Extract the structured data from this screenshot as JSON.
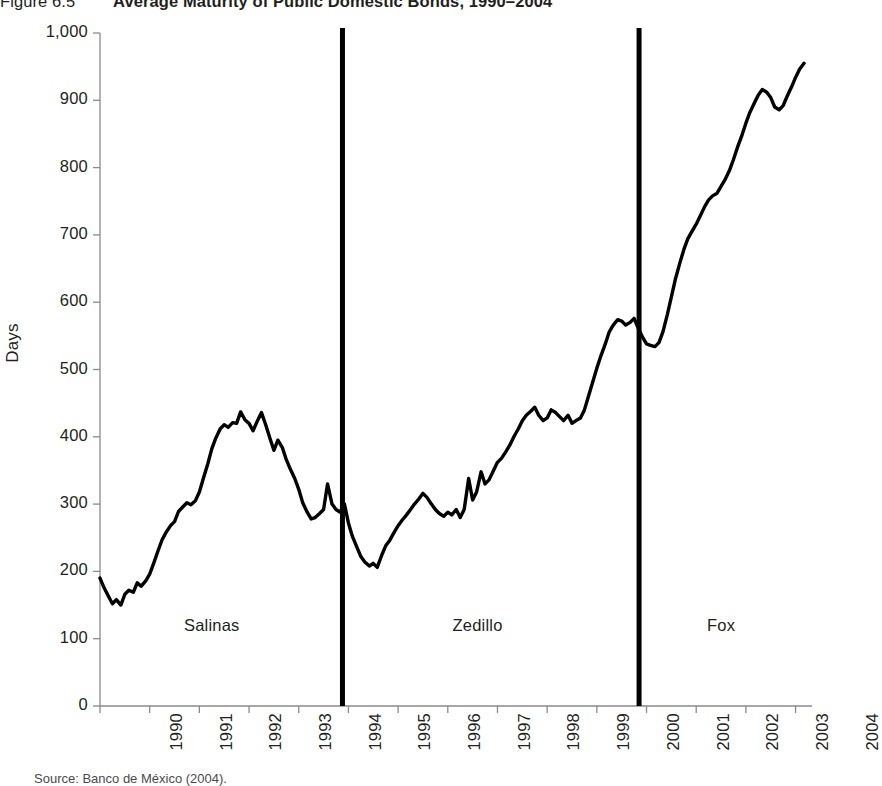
{
  "figure": {
    "number": "Figure 6.5",
    "title": "Average Maturity of Public Domestic Bonds, 1990–2004",
    "source": "Source: Banco de México (2004)."
  },
  "chart_data": {
    "type": "line",
    "title": "Average Maturity of Public Domestic Bonds, 1990–2004",
    "xlabel": "",
    "ylabel": "Days",
    "xlim": [
      1990,
      2004.25
    ],
    "ylim": [
      0,
      1000
    ],
    "grid": false,
    "legend": null,
    "line_color": "#000000",
    "line_width": 3.4,
    "y_ticks": [
      0,
      100,
      200,
      300,
      400,
      500,
      600,
      700,
      800,
      900,
      1000
    ],
    "y_tick_labels": [
      "0",
      "100",
      "200",
      "300",
      "400",
      "500",
      "600",
      "700",
      "800",
      "900",
      "1,000"
    ],
    "x_ticks": [
      1990,
      1991,
      1992,
      1993,
      1994,
      1995,
      1996,
      1997,
      1998,
      1999,
      2000,
      2001,
      2002,
      2003,
      2004
    ],
    "x_tick_labels": [
      "1990",
      "1991",
      "1992",
      "1993",
      "1994",
      "1995",
      "1996",
      "1997",
      "1998",
      "1999",
      "2000",
      "2001",
      "2002",
      "2003",
      "2004"
    ],
    "annotations": [
      {
        "label": "Salinas",
        "x": 1992.25,
        "y": 118
      },
      {
        "label": "Zedillo",
        "x": 1997.6,
        "y": 118
      },
      {
        "label": "Fox",
        "x": 2002.5,
        "y": 118
      }
    ],
    "vertical_rules": [
      {
        "x": 1994.88,
        "label": "Salinas/Zedillo transition",
        "color": "#000000",
        "width": 5
      },
      {
        "x": 2000.85,
        "label": "Zedillo/Fox transition",
        "color": "#000000",
        "width": 5
      }
    ],
    "series": [
      {
        "name": "Average maturity",
        "units": "Days",
        "x": [
          1990.0,
          1990.08,
          1990.17,
          1990.25,
          1990.33,
          1990.42,
          1990.5,
          1990.58,
          1990.67,
          1990.75,
          1990.83,
          1990.92,
          1991.0,
          1991.08,
          1991.17,
          1991.25,
          1991.33,
          1991.42,
          1991.5,
          1991.58,
          1991.67,
          1991.75,
          1991.83,
          1991.92,
          1992.0,
          1992.08,
          1992.17,
          1992.25,
          1992.33,
          1992.42,
          1992.5,
          1992.58,
          1992.67,
          1992.75,
          1992.83,
          1992.92,
          1993.0,
          1993.08,
          1993.17,
          1993.25,
          1993.33,
          1993.42,
          1993.5,
          1993.58,
          1993.67,
          1993.75,
          1993.83,
          1993.92,
          1994.0,
          1994.08,
          1994.17,
          1994.25,
          1994.33,
          1994.42,
          1994.5,
          1994.58,
          1994.67,
          1994.75,
          1994.83,
          1994.92,
          1995.0,
          1995.08,
          1995.17,
          1995.25,
          1995.33,
          1995.42,
          1995.5,
          1995.58,
          1995.67,
          1995.75,
          1995.83,
          1995.92,
          1996.0,
          1996.08,
          1996.17,
          1996.25,
          1996.33,
          1996.42,
          1996.5,
          1996.58,
          1996.67,
          1996.75,
          1996.83,
          1996.92,
          1997.0,
          1997.08,
          1997.17,
          1997.25,
          1997.33,
          1997.42,
          1997.5,
          1997.58,
          1997.67,
          1997.75,
          1997.83,
          1997.92,
          1998.0,
          1998.08,
          1998.17,
          1998.25,
          1998.33,
          1998.42,
          1998.5,
          1998.58,
          1998.67,
          1998.75,
          1998.83,
          1998.92,
          1999.0,
          1999.08,
          1999.17,
          1999.25,
          1999.33,
          1999.42,
          1999.5,
          1999.58,
          1999.67,
          1999.75,
          1999.83,
          1999.92,
          2000.0,
          2000.08,
          2000.17,
          2000.25,
          2000.33,
          2000.42,
          2000.5,
          2000.58,
          2000.67,
          2000.75,
          2000.83,
          2000.92,
          2001.0,
          2001.08,
          2001.17,
          2001.25,
          2001.33,
          2001.42,
          2001.5,
          2001.58,
          2001.67,
          2001.75,
          2001.83,
          2001.92,
          2002.0,
          2002.08,
          2002.17,
          2002.25,
          2002.33,
          2002.42,
          2002.5,
          2002.58,
          2002.67,
          2002.75,
          2002.83,
          2002.92,
          2003.0,
          2003.08,
          2003.17,
          2003.25,
          2003.33,
          2003.42,
          2003.5,
          2003.58,
          2003.67,
          2003.75,
          2003.83,
          2003.92,
          2004.0,
          2004.08,
          2004.17
        ],
        "y": [
          190,
          176,
          163,
          152,
          158,
          150,
          166,
          172,
          169,
          183,
          178,
          186,
          196,
          212,
          231,
          247,
          258,
          268,
          274,
          289,
          296,
          302,
          299,
          305,
          318,
          338,
          360,
          382,
          398,
          412,
          418,
          414,
          421,
          420,
          437,
          425,
          420,
          409,
          424,
          436,
          419,
          398,
          380,
          395,
          384,
          366,
          352,
          338,
          322,
          302,
          288,
          278,
          280,
          286,
          292,
          330,
          300,
          292,
          288,
          300,
          272,
          252,
          236,
          222,
          214,
          208,
          212,
          206,
          224,
          238,
          246,
          258,
          268,
          276,
          284,
          292,
          300,
          308,
          316,
          310,
          300,
          292,
          286,
          282,
          288,
          284,
          292,
          280,
          292,
          338,
          306,
          318,
          348,
          330,
          336,
          350,
          362,
          368,
          378,
          388,
          400,
          412,
          424,
          432,
          438,
          444,
          432,
          424,
          428,
          440,
          436,
          430,
          424,
          432,
          420,
          424,
          428,
          440,
          460,
          482,
          502,
          520,
          538,
          556,
          566,
          574,
          572,
          566,
          570,
          576,
          562,
          548,
          538,
          536,
          534,
          540,
          556,
          582,
          608,
          634,
          658,
          678,
          694,
          706,
          716,
          728,
          742,
          752,
          758,
          762,
          772,
          782,
          796,
          812,
          830,
          848,
          866,
          882,
          896,
          908,
          916,
          912,
          904,
          890,
          886,
          892,
          906,
          920,
          934,
          946,
          955
        ],
        "annotated_points": [
          {
            "label": "initial level",
            "x": 1990.0,
            "y": 190
          },
          {
            "label": "early trough",
            "x": 1990.25,
            "y": 152
          },
          {
            "label": "1992 peak",
            "x": 1992.83,
            "y": 437
          },
          {
            "label": "pre-crisis level",
            "x": 1994.83,
            "y": 288
          },
          {
            "label": "1995 crisis trough",
            "x": 1995.42,
            "y": 208
          },
          {
            "label": "late-1997 spike",
            "x": 1997.42,
            "y": 338
          },
          {
            "label": "2000 plateau",
            "x": 2000.75,
            "y": 576
          },
          {
            "label": "Fox transition low",
            "x": 2001.17,
            "y": 534
          },
          {
            "label": "2003 high",
            "x": 2003.33,
            "y": 916
          },
          {
            "label": "2003 dip",
            "x": 2003.67,
            "y": 886
          },
          {
            "label": "final value",
            "x": 2004.17,
            "y": 955
          }
        ]
      }
    ]
  },
  "axis_geometry": {
    "plot_left_px": 100,
    "plot_right_px": 808,
    "plot_top_px": 33,
    "plot_bottom_px": 706
  }
}
